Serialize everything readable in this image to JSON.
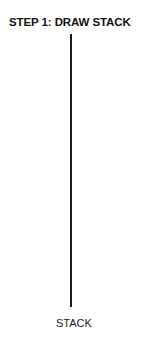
{
  "diagram": {
    "title": "STEP 1: DRAW STACK",
    "stack": {
      "label": "STACK",
      "line_color": "#1a1a1a"
    }
  }
}
